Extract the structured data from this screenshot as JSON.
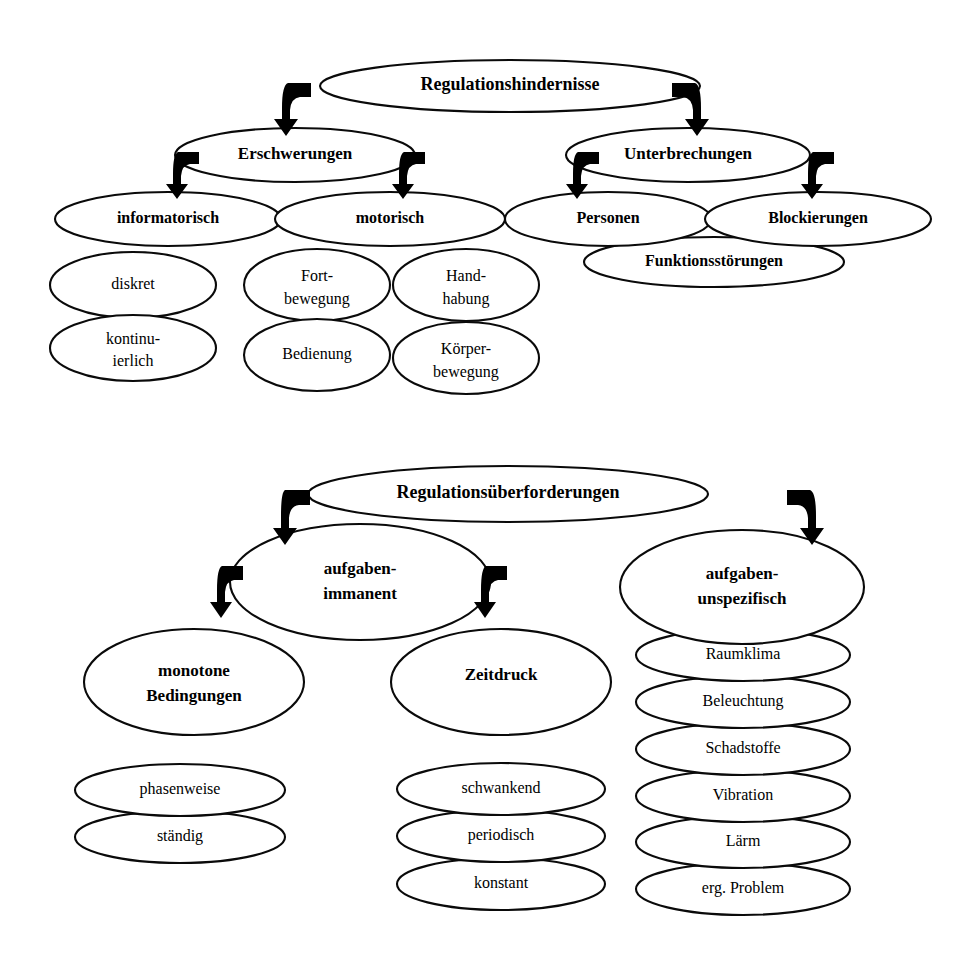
{
  "diagrams": [
    {
      "id": "regulationshindernisse",
      "root": {
        "label": "Regulationshindernisse",
        "cx": 510,
        "cy": 86,
        "rx": 190,
        "ry": 26,
        "bold": true,
        "fs": 18
      },
      "level2": [
        {
          "label": "Erschwerungen",
          "cx": 295,
          "cy": 155,
          "rx": 120,
          "ry": 27,
          "bold": true,
          "fs": 17
        },
        {
          "label": "Unterbrechungen",
          "cx": 688,
          "cy": 155,
          "rx": 122,
          "ry": 27,
          "bold": true,
          "fs": 17
        }
      ],
      "level3": [
        {
          "label": "informatorisch",
          "cx": 168,
          "cy": 219,
          "rx": 113,
          "ry": 27,
          "bold": true,
          "fs": 16
        },
        {
          "label": "motorisch",
          "cx": 390,
          "cy": 219,
          "rx": 115,
          "ry": 27,
          "bold": true,
          "fs": 16
        },
        {
          "label": "Personen",
          "cx": 608,
          "cy": 219,
          "rx": 103,
          "ry": 27,
          "bold": true,
          "fs": 16
        },
        {
          "label": "Blockierungen",
          "cx": 818,
          "cy": 219,
          "rx": 113,
          "ry": 27,
          "bold": true,
          "fs": 16
        },
        {
          "label": "Funktionsstörungen",
          "cx": 714,
          "cy": 262,
          "rx": 130,
          "ry": 25,
          "bold": true,
          "fs": 16
        }
      ],
      "leaves": [
        {
          "label": "diskret",
          "cx": 133,
          "cy": 285,
          "rx": 83,
          "ry": 33,
          "bold": false,
          "fs": 16,
          "lines": [
            "diskret"
          ]
        },
        {
          "label": "kontinu-ierlich",
          "cx": 133,
          "cy": 348,
          "rx": 83,
          "ry": 33,
          "bold": false,
          "fs": 16,
          "lines": [
            "kontinu-",
            "ierlich"
          ]
        },
        {
          "label": "Fortbewegung",
          "cx": 317,
          "cy": 285,
          "rx": 73,
          "ry": 36,
          "bold": false,
          "fs": 16,
          "lines": [
            "Fort-",
            "bewegung"
          ]
        },
        {
          "label": "Handhabung",
          "cx": 466,
          "cy": 285,
          "rx": 73,
          "ry": 36,
          "bold": false,
          "fs": 16,
          "lines": [
            "Hand-",
            "habung"
          ]
        },
        {
          "label": "Bedienung",
          "cx": 317,
          "cy": 355,
          "rx": 73,
          "ry": 36,
          "bold": false,
          "fs": 16,
          "lines": [
            "Bedienung"
          ]
        },
        {
          "label": "Körperbewegung",
          "cx": 466,
          "cy": 358,
          "rx": 73,
          "ry": 36,
          "bold": false,
          "fs": 16,
          "lines": [
            "Körper-",
            "bewegung"
          ]
        }
      ],
      "arrows": [
        {
          "from": "root-left",
          "x": 305,
          "y": 93,
          "dir": "left"
        },
        {
          "from": "root-right",
          "x": 690,
          "y": 93,
          "dir": "right"
        },
        {
          "from": "erschwerungen-left",
          "x": 177,
          "y": 160,
          "dir": "left"
        },
        {
          "from": "erschwerungen-right",
          "x": 410,
          "y": 160,
          "dir": "right"
        },
        {
          "from": "unterbrechungen-left",
          "x": 573,
          "y": 160,
          "dir": "left"
        },
        {
          "from": "unterbrechungen-right",
          "x": 805,
          "y": 160,
          "dir": "right"
        }
      ]
    },
    {
      "id": "regulationsueberforderungen",
      "root": {
        "label": "Regulationsüberforderungen",
        "cx": 508,
        "cy": 494,
        "rx": 200,
        "ry": 28,
        "bold": true,
        "fs": 18
      },
      "level2": [
        {
          "label": "aufgaben-immanent",
          "cx": 360,
          "cy": 582,
          "rx": 130,
          "ry": 58,
          "bold": true,
          "fs": 17,
          "lines": [
            "aufgaben-",
            "immanent"
          ]
        },
        {
          "label": "aufgaben-unspezifisch",
          "cx": 742,
          "cy": 587,
          "rx": 122,
          "ry": 57,
          "bold": true,
          "fs": 17,
          "lines": [
            "aufgaben-",
            "unspezifisch"
          ]
        }
      ],
      "level3": [
        {
          "label": "monotone Bedingungen",
          "cx": 194,
          "cy": 682,
          "rx": 110,
          "ry": 53,
          "bold": true,
          "fs": 17,
          "lines": [
            "monotone",
            "Bedingungen"
          ]
        },
        {
          "label": "Zeitdruck",
          "cx": 501,
          "cy": 682,
          "rx": 110,
          "ry": 53,
          "bold": true,
          "fs": 17,
          "lines": [
            "Zeitdruck"
          ]
        }
      ],
      "leaves_left": [
        {
          "label": "phasenweise",
          "cx": 180,
          "cy": 790,
          "rx": 105,
          "ry": 26,
          "bold": false,
          "fs": 16
        },
        {
          "label": "ständig",
          "cx": 180,
          "cy": 837,
          "rx": 105,
          "ry": 26,
          "bold": false,
          "fs": 16
        }
      ],
      "leaves_mid": [
        {
          "label": "schwankend",
          "cx": 501,
          "cy": 789,
          "rx": 104,
          "ry": 26,
          "bold": false,
          "fs": 16
        },
        {
          "label": "periodisch",
          "cx": 501,
          "cy": 836,
          "rx": 104,
          "ry": 26,
          "bold": false,
          "fs": 16
        },
        {
          "label": "konstant",
          "cx": 501,
          "cy": 884,
          "rx": 104,
          "ry": 26,
          "bold": false,
          "fs": 16
        }
      ],
      "leaves_right": [
        {
          "label": "Raumklima",
          "cx": 743,
          "cy": 655,
          "rx": 107,
          "ry": 26,
          "bold": false,
          "fs": 16
        },
        {
          "label": "Beleuchtung",
          "cx": 743,
          "cy": 702,
          "rx": 107,
          "ry": 26,
          "bold": false,
          "fs": 16
        },
        {
          "label": "Schadstoffe",
          "cx": 743,
          "cy": 749,
          "rx": 107,
          "ry": 26,
          "bold": false,
          "fs": 16
        },
        {
          "label": "Vibration",
          "cx": 743,
          "cy": 796,
          "rx": 107,
          "ry": 26,
          "bold": false,
          "fs": 16
        },
        {
          "label": "Lärm",
          "cx": 743,
          "cy": 842,
          "rx": 107,
          "ry": 26,
          "bold": false,
          "fs": 16
        },
        {
          "label": "erg. Problem",
          "cx": 743,
          "cy": 889,
          "rx": 107,
          "ry": 26,
          "bold": false,
          "fs": 16
        }
      ],
      "arrows": [
        {
          "from": "root2-left",
          "x": 300,
          "y": 500,
          "dir": "left"
        },
        {
          "from": "root2-right",
          "x": 815,
          "y": 500,
          "dir": "right"
        },
        {
          "from": "immanent-left",
          "x": 228,
          "y": 578,
          "dir": "left"
        },
        {
          "from": "immanent-right",
          "x": 492,
          "y": 578,
          "dir": "right"
        }
      ]
    }
  ],
  "colors": {
    "background": "#ffffff",
    "stroke": "#0a0a0a",
    "text": "#000000",
    "arrow": "#000000"
  }
}
